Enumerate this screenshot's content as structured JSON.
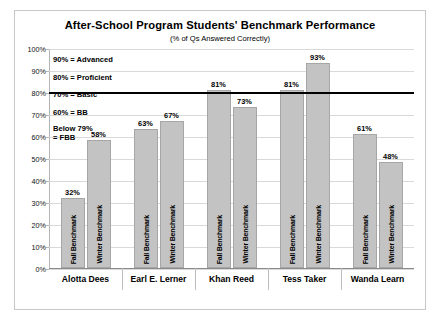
{
  "chart_data": {
    "type": "bar",
    "title": "After-School Program Students' Benchmark Performance",
    "subtitle": "(% of Qs Answered Correctly)",
    "xlabel": "",
    "ylabel": "",
    "ylim": [
      0,
      100
    ],
    "ytick_labels": [
      "0%",
      "10%",
      "20%",
      "30%",
      "40%",
      "50%",
      "60%",
      "70%",
      "80%",
      "90%",
      "100%"
    ],
    "ytick_values": [
      0,
      10,
      20,
      30,
      40,
      50,
      60,
      70,
      80,
      90,
      100
    ],
    "grid": true,
    "legend_position": "in-bar-rotated-labels",
    "categories": [
      "Alotta Dees",
      "Earl E. Lerner",
      "Khan Reed",
      "Tess Taker",
      "Wanda Learn"
    ],
    "series": [
      {
        "name": "Fall Benchmark",
        "values": [
          32,
          63,
          81,
          81,
          61
        ],
        "value_labels": [
          "32%",
          "63%",
          "81%",
          "81%",
          "61%"
        ]
      },
      {
        "name": "Winter Benchmark",
        "values": [
          58,
          67,
          73,
          93,
          48
        ],
        "value_labels": [
          "58%",
          "67%",
          "73%",
          "93%",
          "48%"
        ]
      }
    ],
    "reference_line": {
      "value": 80,
      "label": "80% Proficient benchmark",
      "color": "#000000"
    },
    "bar_color": "#c3c3c3",
    "bar_border_color": "#a6a6a6",
    "annotations": [
      {
        "text": "90% = Advanced",
        "value": 90
      },
      {
        "text": "80% = Proficient",
        "value": 80
      },
      {
        "text": "70% = Basic",
        "value": 70
      },
      {
        "text": "60% = BB",
        "value": 60
      },
      {
        "text": "Below 79%",
        "value": 50
      },
      {
        "text": "= FBB",
        "value": 47
      }
    ]
  }
}
